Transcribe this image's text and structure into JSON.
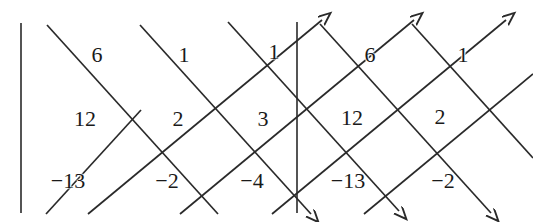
{
  "figure": {
    "background": "#ffffff",
    "stroke_color": "#2a2a2a",
    "text_color": "#1a1a1a",
    "width": 533,
    "height": 222
  },
  "axes": {
    "left_vertical_rule": {
      "x": 21,
      "y1": 23,
      "y2": 213
    },
    "center_vertical_rule": {
      "x": 297,
      "y1": 22,
      "y2": 213
    }
  },
  "labels": [
    {
      "name": "label-6-top-left",
      "text": "6",
      "x": 97,
      "y": 55
    },
    {
      "name": "label-1-top-mid",
      "text": "1",
      "x": 184,
      "y": 55
    },
    {
      "name": "label-1-top-center",
      "text": "1",
      "x": 274,
      "y": 52
    },
    {
      "name": "label-6-top-right",
      "text": "6",
      "x": 370,
      "y": 55
    },
    {
      "name": "label-1-top-far-right",
      "text": "1",
      "x": 463,
      "y": 55
    },
    {
      "name": "label-12-mid-left",
      "text": "12",
      "x": 85,
      "y": 119
    },
    {
      "name": "label-2-mid-a",
      "text": "2",
      "x": 178,
      "y": 119
    },
    {
      "name": "label-3-mid-b",
      "text": "3",
      "x": 263,
      "y": 119
    },
    {
      "name": "label-12-mid-center",
      "text": "12",
      "x": 352,
      "y": 118
    },
    {
      "name": "label-2-mid-right",
      "text": "2",
      "x": 440,
      "y": 117
    },
    {
      "name": "label-neg13-bottom-left",
      "text": "−13",
      "x": 68,
      "y": 181
    },
    {
      "name": "label-neg2-bottom-a",
      "text": "−2",
      "x": 167,
      "y": 181
    },
    {
      "name": "label-neg4-bottom-b",
      "text": "−4",
      "x": 252,
      "y": 181
    },
    {
      "name": "label-neg13-bottom-center",
      "text": "−13",
      "x": 348,
      "y": 181
    },
    {
      "name": "label-neg2-bottom-right",
      "text": "−2",
      "x": 443,
      "y": 181
    }
  ],
  "descending_arrows": [
    {
      "name": "desc-arrow-1",
      "x1": 47,
      "y1": 25,
      "x2": 218,
      "y2": 214,
      "arrowhead": false
    },
    {
      "name": "desc-arrow-2",
      "x1": 140,
      "y1": 25,
      "x2": 311,
      "y2": 214,
      "arrowhead": true
    },
    {
      "name": "desc-arrow-3",
      "x1": 228,
      "y1": 22,
      "x2": 399,
      "y2": 211,
      "arrowhead": true
    },
    {
      "name": "desc-arrow-4",
      "x1": 320,
      "y1": 24,
      "x2": 491,
      "y2": 213,
      "arrowhead": true
    },
    {
      "name": "desc-arrow-5",
      "x1": 412,
      "y1": 24,
      "x2": 533,
      "y2": 158,
      "arrowhead": false
    }
  ],
  "ascending_arrows": [
    {
      "name": "asc-arrow-1",
      "x1": 46,
      "y1": 214,
      "x2": 141,
      "y2": 110,
      "arrowhead": false
    },
    {
      "name": "asc-arrow-2",
      "x1": 88,
      "y1": 214,
      "x2": 322,
      "y2": 20,
      "arrowhead": true
    },
    {
      "name": "asc-arrow-3",
      "x1": 180,
      "y1": 214,
      "x2": 414,
      "y2": 20,
      "arrowhead": true
    },
    {
      "name": "asc-arrow-4",
      "x1": 272,
      "y1": 214,
      "x2": 506,
      "y2": 20,
      "arrowhead": true
    },
    {
      "name": "asc-arrow-5",
      "x1": 364,
      "y1": 214,
      "x2": 533,
      "y2": 74,
      "arrowhead": false
    }
  ]
}
